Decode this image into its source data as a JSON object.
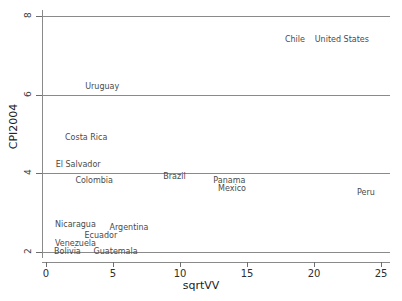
{
  "chart_data": {
    "type": "scatter",
    "title": "",
    "subtitle": "",
    "xlabel": "sqrtVV",
    "ylabel": "CPI2004",
    "xlim": [
      -0.3,
      25.7
    ],
    "ylim": [
      1.85,
      8.15
    ],
    "xticks": [
      0,
      5,
      10,
      15,
      20,
      25
    ],
    "yticks": [
      2,
      4,
      6,
      8
    ],
    "xtick_labels": [
      "0",
      "5",
      "10",
      "15",
      "20",
      "25"
    ],
    "ytick_labels": [
      "2",
      "4",
      "6",
      "8"
    ],
    "grid": "horizontal",
    "legend": "none",
    "marker_style": "text-labels-only",
    "points": [
      {
        "label": "Chile",
        "x": 18.6,
        "y": 7.4
      },
      {
        "label": "United States",
        "x": 22.1,
        "y": 7.4
      },
      {
        "label": "Uruguay",
        "x": 4.2,
        "y": 6.2
      },
      {
        "label": "Costa Rica",
        "x": 3.0,
        "y": 4.9
      },
      {
        "label": "El Salvador",
        "x": 2.4,
        "y": 4.2
      },
      {
        "label": "Colombia",
        "x": 3.6,
        "y": 3.8
      },
      {
        "label": "Brazil",
        "x": 9.6,
        "y": 3.9
      },
      {
        "label": "Panama",
        "x": 13.7,
        "y": 3.8
      },
      {
        "label": "Mexico",
        "x": 13.9,
        "y": 3.6
      },
      {
        "label": "Peru",
        "x": 23.9,
        "y": 3.5
      },
      {
        "label": "Nicaragua",
        "x": 2.2,
        "y": 2.7
      },
      {
        "label": "Argentina",
        "x": 6.2,
        "y": 2.6
      },
      {
        "label": "Ecuador",
        "x": 4.1,
        "y": 2.4
      },
      {
        "label": "Venezuela",
        "x": 2.2,
        "y": 2.2
      },
      {
        "label": "Guatemala",
        "x": 5.2,
        "y": 2.0
      },
      {
        "label": "Bolivia",
        "x": 1.6,
        "y": 2.0
      }
    ]
  }
}
